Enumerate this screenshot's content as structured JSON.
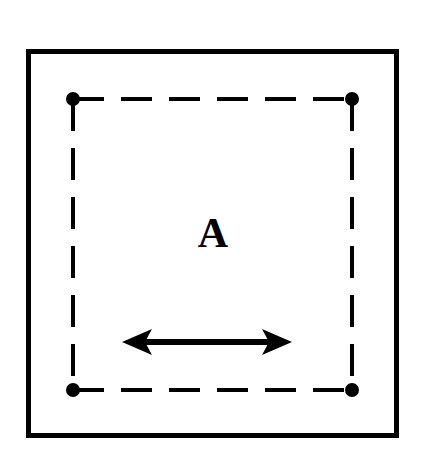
{
  "figure": {
    "title": "",
    "background_color": "#ffffff",
    "stroke_color": "#000000",
    "width": 422,
    "height": 460,
    "outer_frame": {
      "name": "solid-square-boundary",
      "x": 26,
      "y": 49,
      "width": 373,
      "height": 389,
      "line_width": 5,
      "style": "solid"
    },
    "inner_frame": {
      "name": "dashed-square-region",
      "x": 73,
      "y": 99,
      "width": 279,
      "height": 291,
      "line_width": 4,
      "style": "dashed",
      "dash_length": 30,
      "gap_length": 18
    },
    "corner_markers": {
      "name": "corner-dot",
      "count": 4,
      "radius": 7,
      "fill": "#000000",
      "positions": [
        {
          "label": "top-left",
          "x": 73,
          "y": 99
        },
        {
          "label": "top-right",
          "x": 352,
          "y": 99
        },
        {
          "label": "bottom-left",
          "x": 73,
          "y": 390
        },
        {
          "label": "bottom-right",
          "x": 352,
          "y": 390
        }
      ]
    },
    "region_label": {
      "text": "A",
      "x": 213,
      "y": 236,
      "font_size": 42,
      "font_weight": "bold",
      "color": "#000000"
    },
    "arrow": {
      "name": "double-headed-horizontal-arrow",
      "x1": 122,
      "x2": 292,
      "y": 342,
      "shaft_width": 6,
      "head_length": 30,
      "head_half_width": 13,
      "head_notch": 7,
      "color": "#000000",
      "heads": "both"
    }
  }
}
